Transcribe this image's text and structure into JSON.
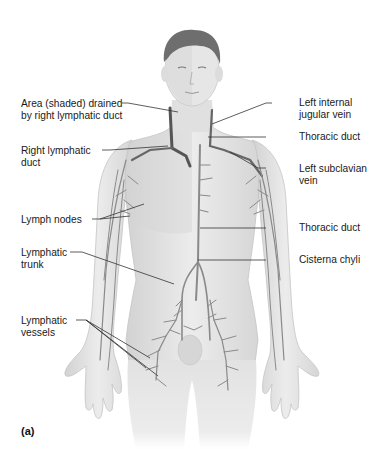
{
  "figure": {
    "panel_label": "(a)",
    "colors": {
      "skin": "#e4e4e4",
      "skin_shade": "#cfcfcf",
      "shaded_area": "#d6d6d6",
      "hair": "#6e6e6e",
      "vessel": "#8a8a8a",
      "duct": "#555555",
      "leader": "#333333"
    },
    "labels_left": [
      {
        "id": "area-shaded",
        "lines": [
          "Area (shaded) drained",
          "by right lymphatic duct"
        ]
      },
      {
        "id": "right-lymphatic-duct",
        "lines": [
          "Right lymphatic",
          "duct"
        ]
      },
      {
        "id": "lymph-nodes",
        "lines": [
          "Lymph nodes"
        ]
      },
      {
        "id": "lymphatic-trunk",
        "lines": [
          "Lymphatic",
          "trunk"
        ]
      },
      {
        "id": "lymphatic-vessels",
        "lines": [
          "Lymphatic",
          "vessels"
        ]
      }
    ],
    "labels_right": [
      {
        "id": "left-internal-jugular-vein",
        "lines": [
          "Left internal",
          "jugular vein"
        ]
      },
      {
        "id": "thoracic-duct-upper",
        "lines": [
          "Thoracic duct"
        ]
      },
      {
        "id": "left-subclavian-vein",
        "lines": [
          "Left subclavian",
          "vein"
        ]
      },
      {
        "id": "thoracic-duct-lower",
        "lines": [
          "Thoracic duct"
        ]
      },
      {
        "id": "cisterna-chyli",
        "lines": [
          "Cisterna chyli"
        ]
      }
    ]
  }
}
